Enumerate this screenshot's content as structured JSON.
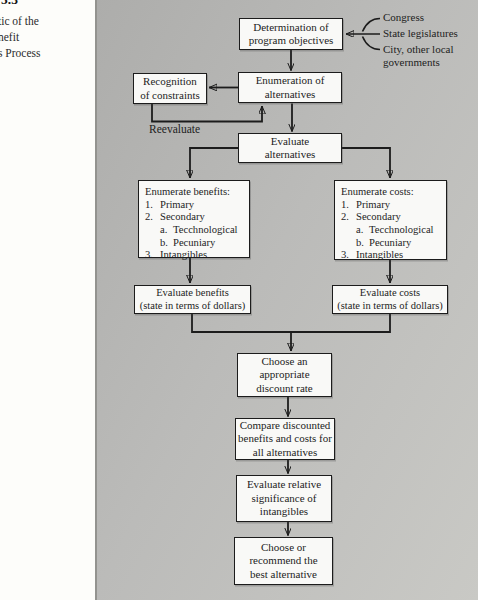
{
  "caption": {
    "figure_number": "5.3",
    "line1": "tic of the",
    "line2": "nefit",
    "line3": "s Process"
  },
  "flowchart": {
    "determination": "Determination of\nprogram objectives",
    "sources": [
      "Congress",
      "State legislatures",
      "City, other local\ngovernments"
    ],
    "enumeration": "Enumeration of\nalternatives",
    "recognition": "Recognition\nof constraints",
    "reevaluate": "Reevaluate",
    "evaluate_alternatives": "Evaluate\nalternatives",
    "enumerate_benefits": {
      "title": "Enumerate benefits:",
      "items": [
        {
          "num": "1.",
          "text": "Primary"
        },
        {
          "num": "2.",
          "text": "Secondary"
        },
        {
          "num": "a.",
          "text": "Tecchnological"
        },
        {
          "num": "b.",
          "text": "Pecuniary"
        },
        {
          "num": "3.",
          "text": "Intangibles"
        }
      ]
    },
    "enumerate_costs": {
      "title": "Enumerate costs:",
      "items": [
        {
          "num": "1.",
          "text": "Primary"
        },
        {
          "num": "2.",
          "text": "Secondary"
        },
        {
          "num": "a.",
          "text": "Tecchnological"
        },
        {
          "num": "b.",
          "text": "Pecuniary"
        },
        {
          "num": "3.",
          "text": "Intangibles"
        }
      ]
    },
    "evaluate_benefits": "Evaluate benefits\n(state in terms of dollars)",
    "evaluate_costs": "Evaluate costs\n(state in terms of dollars)",
    "choose_discount_rate": "Choose an\nappropriate\ndiscount rate",
    "compare_discounted": "Compare discounted\nbenefits and costs for\nall alternatives",
    "evaluate_intangibles": "Evaluate relative\nsignificance of\nintangibles",
    "choose_best": "Choose or\nrecommend the\nbest alternative"
  },
  "colors": {
    "line": "#1c1c1c",
    "box_fill": "#f9f9f7",
    "panel_dark": "#adadab",
    "panel_light": "#c9c9c5"
  }
}
